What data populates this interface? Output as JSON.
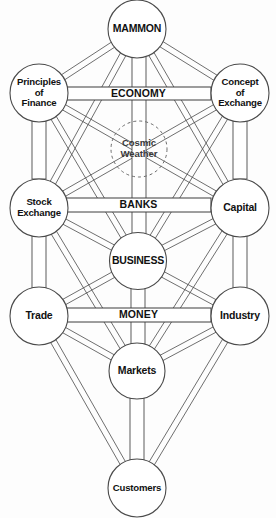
{
  "diagram": {
    "type": "tree-of-life-diagram",
    "colors": {
      "background": "#fdfdfd",
      "node_fill": "#ffffff",
      "stroke": "#4a4a4a",
      "text": "#111111",
      "veil_stroke": "#6b6b6b"
    },
    "nodes": [
      {
        "id": "mammon",
        "label": "MAMMON",
        "lines": [
          "MAMMON"
        ],
        "cx": 137,
        "cy": 29,
        "r": 29,
        "style": "solid",
        "label_style": "caps"
      },
      {
        "id": "principles",
        "label": "Principles of Finance",
        "lines": [
          "Principles",
          "of",
          "Finance"
        ],
        "cx": 39,
        "cy": 93,
        "r": 29,
        "style": "solid",
        "label_style": "title"
      },
      {
        "id": "concept",
        "label": "Concept of Exchange",
        "lines": [
          "Concept",
          "of",
          "Exchange"
        ],
        "cx": 240,
        "cy": 93,
        "r": 29,
        "style": "solid",
        "label_style": "title"
      },
      {
        "id": "cosmic",
        "label": "Cosmic Weather",
        "lines": [
          "Cosmic",
          "Weather"
        ],
        "cx": 139,
        "cy": 149,
        "r": 28,
        "style": "dashed",
        "label_style": "title"
      },
      {
        "id": "stock",
        "label": "Stock Exchange",
        "lines": [
          "Stock",
          "Exchange"
        ],
        "cx": 39,
        "cy": 208,
        "r": 29,
        "style": "solid",
        "label_style": "title"
      },
      {
        "id": "capital",
        "label": "Capital",
        "lines": [
          "Capital"
        ],
        "cx": 240,
        "cy": 208,
        "r": 29,
        "style": "solid",
        "label_style": "title"
      },
      {
        "id": "business",
        "label": "BUSINESS",
        "lines": [
          "BUSINESS"
        ],
        "cx": 138,
        "cy": 261,
        "r": 28.5,
        "style": "solid",
        "label_style": "caps"
      },
      {
        "id": "trade",
        "label": "Trade",
        "lines": [
          "Trade"
        ],
        "cx": 39,
        "cy": 316,
        "r": 29,
        "style": "solid",
        "label_style": "title"
      },
      {
        "id": "industry",
        "label": "Industry",
        "lines": [
          "Industry"
        ],
        "cx": 240,
        "cy": 316,
        "r": 29,
        "style": "solid",
        "label_style": "title"
      },
      {
        "id": "markets",
        "label": "Markets",
        "lines": [
          "Markets"
        ],
        "cx": 137,
        "cy": 371,
        "r": 28,
        "style": "solid",
        "label_style": "title"
      },
      {
        "id": "customers",
        "label": "Customers",
        "lines": [
          "Customers"
        ],
        "cx": 137,
        "cy": 488,
        "r": 29,
        "style": "solid",
        "label_style": "title"
      }
    ],
    "bands": [
      {
        "id": "economy",
        "label": "ECONOMY",
        "x": 66,
        "y": 87,
        "width": 145,
        "height": 13
      },
      {
        "id": "banks",
        "label": "BANKS",
        "x": 66,
        "y": 198,
        "width": 145,
        "height": 14
      },
      {
        "id": "money",
        "label": "MONEY",
        "x": 66,
        "y": 308,
        "width": 145,
        "height": 14
      }
    ],
    "vertical_channels": [
      {
        "id": "mammon-business",
        "x": 132,
        "y": 53,
        "width": 14,
        "height": 181
      },
      {
        "id": "business-markets",
        "x": 131,
        "y": 288,
        "width": 14,
        "height": 56
      },
      {
        "id": "markets-customers",
        "x": 130,
        "y": 398,
        "width": 14,
        "height": 62
      },
      {
        "id": "principles-stock",
        "x": 32,
        "y": 121,
        "width": 14,
        "height": 58
      },
      {
        "id": "concept-capital",
        "x": 233,
        "y": 121,
        "width": 14,
        "height": 58
      },
      {
        "id": "stock-trade",
        "x": 32,
        "y": 236,
        "width": 14,
        "height": 52
      },
      {
        "id": "capital-industry",
        "x": 233,
        "y": 236,
        "width": 14,
        "height": 52
      }
    ],
    "edges": [
      {
        "from": "mammon",
        "to": "principles"
      },
      {
        "from": "mammon",
        "to": "concept"
      },
      {
        "from": "mammon",
        "to": "stock"
      },
      {
        "from": "mammon",
        "to": "capital"
      },
      {
        "from": "principles",
        "to": "stock"
      },
      {
        "from": "principles",
        "to": "business"
      },
      {
        "from": "principles",
        "to": "capital"
      },
      {
        "from": "concept",
        "to": "capital"
      },
      {
        "from": "concept",
        "to": "business"
      },
      {
        "from": "concept",
        "to": "stock"
      },
      {
        "from": "stock",
        "to": "capital"
      },
      {
        "from": "stock",
        "to": "business"
      },
      {
        "from": "stock",
        "to": "trade"
      },
      {
        "from": "stock",
        "to": "markets"
      },
      {
        "from": "capital",
        "to": "business"
      },
      {
        "from": "capital",
        "to": "industry"
      },
      {
        "from": "capital",
        "to": "markets"
      },
      {
        "from": "business",
        "to": "trade"
      },
      {
        "from": "business",
        "to": "industry"
      },
      {
        "from": "business",
        "to": "markets"
      },
      {
        "from": "trade",
        "to": "industry"
      },
      {
        "from": "trade",
        "to": "markets"
      },
      {
        "from": "trade",
        "to": "customers"
      },
      {
        "from": "industry",
        "to": "markets"
      },
      {
        "from": "industry",
        "to": "customers"
      },
      {
        "from": "markets",
        "to": "customers"
      }
    ]
  }
}
